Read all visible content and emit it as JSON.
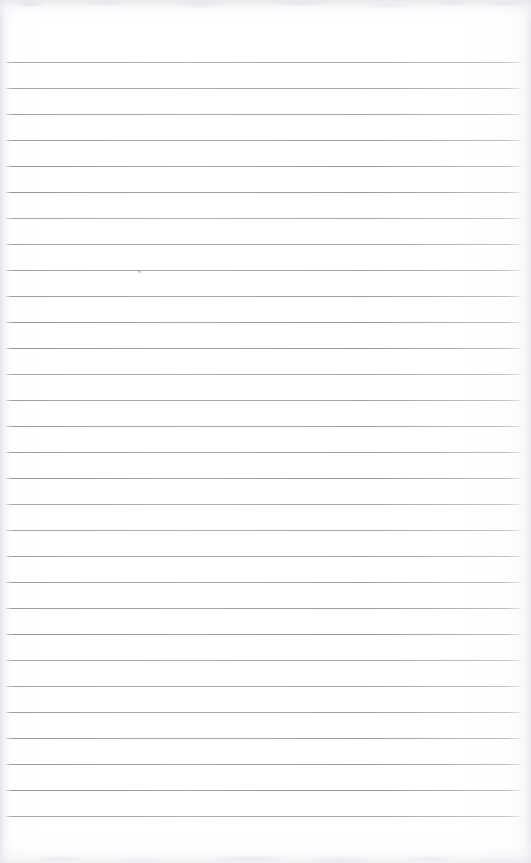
{
  "page": {
    "kind": "scanned-lined-paper",
    "width": 531,
    "height": 863,
    "paper_color": "#ffffff",
    "rule_color": "#8a8e98",
    "edge_shadow_color": "#e2e4e8",
    "text_content": "",
    "handwriting_present": "no",
    "printed_text_present": "no"
  },
  "rules": {
    "count": 30,
    "first_line_y": 62,
    "spacing": 26,
    "line_start_x": 6,
    "line_end_x": 521,
    "thickness": 1,
    "positions": [
      62,
      88,
      114,
      140,
      166,
      192,
      218,
      244,
      270,
      296,
      322,
      348,
      374,
      400,
      426,
      452,
      478,
      504,
      530,
      556,
      582,
      608,
      634,
      660,
      686,
      712,
      738,
      764,
      790,
      816
    ]
  },
  "margins": {
    "top_blank_height": 62,
    "bottom_blank_height": 47,
    "left_edge_band_width": 14,
    "right_edge_band_width": 16
  },
  "artifacts": {
    "stray_speck": {
      "x": 138,
      "y": 271,
      "size": 3
    },
    "top_edge_noise": "faint grey scanner noise band",
    "bottom_edge_noise": "faint grey scanner noise band"
  }
}
